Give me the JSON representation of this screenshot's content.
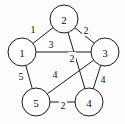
{
  "figure": {
    "kind": "weighted-undirected-graph",
    "background_color": "#fdfdfd",
    "stroke_color": "#1a1a1a",
    "node_fill_color": "#ffffff",
    "text_color": "#111111"
  },
  "graph": {
    "node_radius": 14,
    "nodes": [
      {
        "id": "1",
        "label": "1",
        "cx": 22,
        "cy": 52
      },
      {
        "id": "2",
        "label": "2",
        "cx": 64,
        "cy": 19
      },
      {
        "id": "3",
        "label": "3",
        "cx": 105,
        "cy": 52
      },
      {
        "id": "4",
        "label": "4",
        "cx": 89,
        "cy": 102
      },
      {
        "id": "5",
        "label": "5",
        "cx": 36,
        "cy": 102
      }
    ],
    "edges": [
      {
        "id": "e-1-2",
        "from": "1",
        "to": "2",
        "weight": "1",
        "lx": 33,
        "ly": 29
      },
      {
        "id": "e-2-3",
        "from": "2",
        "to": "3",
        "weight": "2",
        "lx": 86,
        "ly": 30
      },
      {
        "id": "e-1-3",
        "from": "1",
        "to": "3",
        "weight": "3",
        "lx": 51,
        "ly": 44
      },
      {
        "id": "e-2-4",
        "from": "2",
        "to": "4",
        "weight": "2",
        "lx": 72,
        "ly": 58
      },
      {
        "id": "e-3-5",
        "from": "3",
        "to": "5",
        "weight": "4",
        "lx": 55,
        "ly": 74
      },
      {
        "id": "e-1-5",
        "from": "1",
        "to": "5",
        "weight": "5",
        "lx": 21,
        "ly": 76
      },
      {
        "id": "e-3-4",
        "from": "3",
        "to": "4",
        "weight": "4",
        "lx": 103,
        "ly": 79
      },
      {
        "id": "e-4-5",
        "from": "4",
        "to": "5",
        "weight": "2",
        "lx": 63,
        "ly": 105
      }
    ]
  }
}
